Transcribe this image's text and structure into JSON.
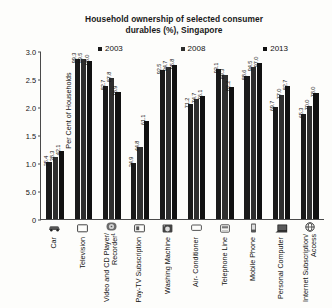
{
  "chart_data": {
    "type": "bar",
    "title": "Household ownership of selected consumer durables (%), Singapore",
    "title_line1": "Household ownership of selected consumer",
    "title_line2": "durables (%), Singapore",
    "xlabel": "",
    "ylabel": "Per Cent of Households",
    "ylim": [
      0,
      3.0
    ],
    "ytick_labels": [
      "3.0",
      "2.5",
      "2.0",
      "1.5",
      "1.0",
      "5.0",
      "0"
    ],
    "ytick_values": [
      3.0,
      2.5,
      2.0,
      1.5,
      1.0,
      0.5,
      0
    ],
    "grid": false,
    "legend_position": "top",
    "value_label_rotation": -90,
    "categories": [
      "Car",
      "Television",
      "Video and CD Player/ Recorder¹",
      "Pay-TV Subscription",
      "Washing Machine",
      "Air- Conditioner",
      "Telephone Line",
      "Mobile Phone",
      "Personal Computer",
      "Internet Subscription/ Access"
    ],
    "category_icons": [
      "car-icon",
      "television-icon",
      "disc-player-icon",
      "pay-tv-icon",
      "washing-machine-icon",
      "air-conditioner-icon",
      "telephone-icon",
      "mobile-phone-icon",
      "computer-icon",
      "internet-globe-icon"
    ],
    "series": [
      {
        "name": "2003",
        "color": "#1a1a1a",
        "values": [
          35.4,
          99.3,
          82.7,
          34.9,
          92.5,
          71.2,
          93.1,
          88.6,
          69.7,
          65.3
        ]
      },
      {
        "name": "2008",
        "color": "#2e2e2e",
        "values": [
          38.3,
          99.5,
          87.8,
          44.8,
          94.7,
          74.7,
          89.3,
          94.5,
          77.0,
          70.0
        ]
      },
      {
        "name": "2013",
        "color": "#111111",
        "values": [
          42.1,
          98.0,
          78.9,
          61.1,
          95.8,
          76.1,
          82.2,
          97.0,
          82.7,
          78.0
        ]
      }
    ]
  },
  "legend": {
    "items": [
      {
        "label": "2003",
        "color": "#1a1a1a"
      },
      {
        "label": "2008",
        "color": "#2e2e2e"
      },
      {
        "label": "2013",
        "color": "#111111"
      }
    ]
  }
}
